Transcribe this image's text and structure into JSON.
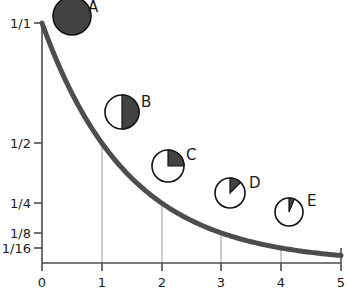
{
  "chart_data": {
    "type": "line",
    "title": "",
    "xlabel": "",
    "ylabel": "",
    "x": [
      0,
      1,
      2,
      3,
      4,
      5
    ],
    "values": [
      1,
      0.5,
      0.25,
      0.125,
      0.0625,
      0.03125
    ],
    "curve_expression": "y = 1/2^x",
    "xlim": [
      0,
      5
    ],
    "ylim": [
      0,
      1
    ],
    "grid": "vertical droplines at x = 1, 2, 3, 4",
    "legend": "none",
    "x_ticks": [
      {
        "value": "0",
        "x": 0
      },
      {
        "value": "1",
        "x": 1
      },
      {
        "value": "2",
        "x": 2
      },
      {
        "value": "3",
        "x": 3
      },
      {
        "value": "4",
        "x": 4
      },
      {
        "value": "5",
        "x": 5
      }
    ],
    "y_ticks": [
      {
        "label": "1/1",
        "value": 1
      },
      {
        "label": "1/2",
        "value": 0.5
      },
      {
        "label": "1/4",
        "value": 0.25
      },
      {
        "label": "1/8",
        "value": 0.125
      },
      {
        "label": "1/16",
        "value": 0.0625
      }
    ],
    "annotations": [
      {
        "label": "A",
        "x": 0,
        "fraction_filled": 1,
        "fraction_text": "1/1"
      },
      {
        "label": "B",
        "x": 1,
        "fraction_filled": 0.5,
        "fraction_text": "1/2"
      },
      {
        "label": "C",
        "x": 2,
        "fraction_filled": 0.25,
        "fraction_text": "1/4"
      },
      {
        "label": "D",
        "x": 3,
        "fraction_filled": 0.125,
        "fraction_text": "1/8"
      },
      {
        "label": "E",
        "x": 4,
        "fraction_filled": 0.0625,
        "fraction_text": "1/16"
      }
    ],
    "colors": {
      "curve": "#4d4d4d",
      "axis": "#4d4d4d",
      "gridline": "#9a9a9a",
      "pie_fill": "#434343",
      "pie_stroke": "#1a1a1a",
      "background": "#ffffff",
      "text": "#1a1a1a"
    }
  }
}
